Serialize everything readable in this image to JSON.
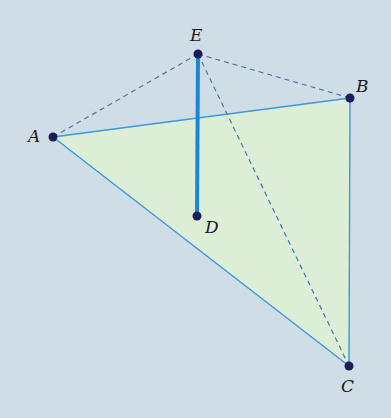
{
  "figure": {
    "background": "#cfdde6",
    "face_fill": "#dcefd6",
    "edge_color": "#3d97dc",
    "thick_edge_color": "#1d86d2",
    "dashed_color": "#4a78a8",
    "point_color": "#1c1c5a"
  },
  "points": {
    "A": {
      "label": "A",
      "x": 53,
      "y": 137
    },
    "B": {
      "label": "B",
      "x": 350,
      "y": 98
    },
    "C": {
      "label": "C",
      "x": 349,
      "y": 366
    },
    "D": {
      "label": "D",
      "x": 197,
      "y": 216
    },
    "E": {
      "label": "E",
      "x": 198,
      "y": 54
    }
  },
  "segments": {
    "solid": [
      "AB",
      "AC",
      "BC"
    ],
    "thick": [
      "ED"
    ],
    "dashed": [
      "EA",
      "EB",
      "EC"
    ]
  }
}
